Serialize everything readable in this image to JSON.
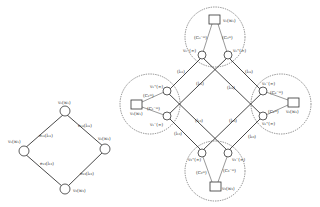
{
  "left_graph": {
    "nodes": {
      "top": "v₀(w₀)",
      "left": "v₁(w₁)",
      "right": "v₂(w₂)",
      "bottom": "v₃(w₃)"
    },
    "edges": {
      "top_left": "e₀₁(l₀₁)",
      "top_right": "e₀₂(l₀₂)",
      "bottom_left": "e₁₃(l₁₃)",
      "bottom_right": "e₂₃(l₂₃)"
    }
  },
  "right_graph": {
    "clusters": {
      "top": {
        "square": "v₀(w₀)",
        "in_node": "v₀⁻(∞)",
        "out_node": "v₀⁺(∞)",
        "in_edge": "(C₀⁻ᵐ)",
        "out_edge": "(C₀ᵐ)"
      },
      "left": {
        "square": "v₁(w₁)",
        "in_node": "v₁⁻(∞)",
        "out_node": "v₁⁺(∞)",
        "in_edge": "(C₁ᵐ)",
        "out_edge": "(C₁⁻ᵐ)"
      },
      "right": {
        "square": "v₂(w₂)",
        "in_node": "v₂⁻(∞)",
        "out_node": "v₂⁺(∞)",
        "in_edge": "(C₂⁻ᵐ)",
        "out_edge": "(C₂ᵐ)"
      },
      "bottom": {
        "square": "v₃(w₃)",
        "in_node": "v₃⁻(∞)",
        "out_node": "v₃⁺(∞)",
        "in_edge": "(C₃ᵐ)",
        "out_edge": "(C₃⁻ᵐ)"
      }
    },
    "edge_labels": {
      "outer_top_left": "(l₀₁)",
      "inner_top_left": "(l₀₁)",
      "outer_top_right": "(l₀₂)",
      "inner_top_right": "(l₀₂)",
      "outer_bottom_left": "(l₁₃)",
      "inner_bottom_left": "(l₁₃)",
      "outer_bottom_right": "(l₂₃)",
      "inner_bottom_right": "(l₂₃)"
    }
  }
}
